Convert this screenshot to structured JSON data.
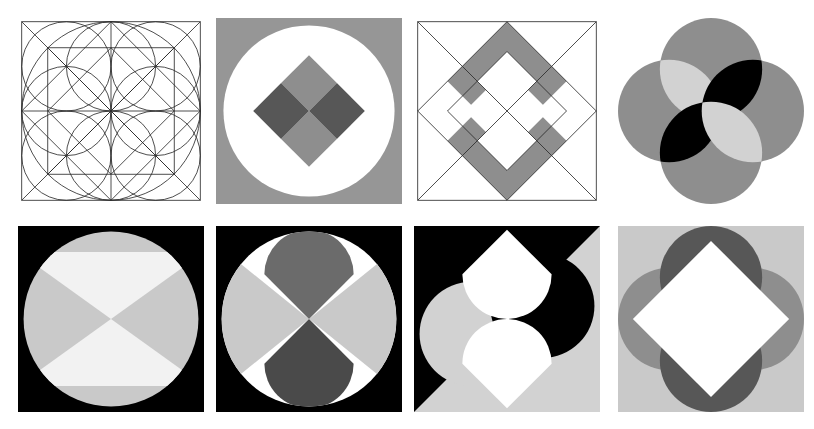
{
  "sheet": {
    "title": "Geometric composition plate",
    "width": 814,
    "height": 429,
    "background": "#ffffff",
    "rows": 2,
    "columns": 4,
    "panel_count": 8
  },
  "palette": {
    "white": "#ffffff",
    "near_white": "#f2f2f2",
    "light_gray": "#d2d2d2",
    "pale_gray": "#c9c9c9",
    "mid_gray": "#969696",
    "gray": "#8e8e8e",
    "dark_gray": "#6b6b6b",
    "darker_gray": "#575757",
    "charcoal": "#4a4a4a",
    "black": "#000000",
    "stroke": "#2b2b2b"
  },
  "panels": [
    {
      "index": 1,
      "name": "construction-grid",
      "row": 1,
      "column": 1,
      "x": 18,
      "y": 18,
      "width": 186,
      "height": 186,
      "background": "#ffffff",
      "style": "line-drawing",
      "description": "Square with inscribed circle, diagonals, midlines, rotated inner square and four tangent circles",
      "elements": [
        "outer-square",
        "inscribed-circle",
        "diagonals",
        "midlines",
        "inner-diamond",
        "inner-square",
        "four-quadrant-circles"
      ],
      "stroke_color": "#2b2b2b",
      "fill_color": "none"
    },
    {
      "index": 2,
      "name": "circle-quartered-diamond",
      "row": 1,
      "column": 2,
      "x": 216,
      "y": 18,
      "width": 186,
      "height": 186,
      "background": "#969696",
      "style": "solid-fill",
      "description": "Gray square, white inscribed circle, diamond split in four quadrants",
      "elements": [
        "gray-square",
        "white-circle",
        "diamond-top-quadrant",
        "diamond-bottom-quadrant",
        "diamond-left-quadrant",
        "diamond-right-quadrant"
      ],
      "fills": {
        "square": "#969696",
        "circle": "#ffffff",
        "diamond_vertical": "#8e8e8e",
        "diamond_horizontal": "#575757"
      }
    },
    {
      "index": 3,
      "name": "nested-diamond-band",
      "row": 1,
      "column": 3,
      "x": 414,
      "y": 18,
      "width": 186,
      "height": 186,
      "background": "#ffffff",
      "style": "line-drawing",
      "description": "Square with diagonals, large diamond and smaller inner diamond; band shaded gray at top and bottom chevrons",
      "elements": [
        "outer-square",
        "diagonals",
        "outer-diamond",
        "inner-diamond",
        "top-chevron-band",
        "bottom-chevron-band"
      ],
      "stroke_color": "#2b2b2b",
      "band_fill": "#8e8e8e"
    },
    {
      "index": 4,
      "name": "four-circle-rosette",
      "row": 1,
      "column": 4,
      "x": 618,
      "y": 18,
      "width": 186,
      "height": 186,
      "background": "#ffffff",
      "style": "solid-fill",
      "description": "Four overlapping gray circles in a cross; lens intersections alternate light and black",
      "elements": [
        "circle-top",
        "circle-right",
        "circle-bottom",
        "circle-left",
        "lens-top-left-light",
        "lens-top-right-black",
        "lens-bottom-left-black",
        "lens-bottom-right-light"
      ],
      "fills": {
        "circles": "#8e8e8e",
        "lens_light": "#d2d2d2",
        "lens_dark": "#000000"
      }
    },
    {
      "index": 5,
      "name": "hourglass-in-circle",
      "row": 2,
      "column": 1,
      "x": 18,
      "y": 226,
      "width": 186,
      "height": 186,
      "background": "#000000",
      "style": "solid-fill",
      "description": "Black square, light gray circle, white hourglass of two triangles meeting at centre",
      "elements": [
        "black-square",
        "gray-circle",
        "triangle-top",
        "triangle-bottom"
      ],
      "fills": {
        "square": "#000000",
        "circle": "#c9c9c9",
        "triangles": "#f2f2f2"
      }
    },
    {
      "index": 6,
      "name": "four-lobe-circle",
      "row": 2,
      "column": 2,
      "x": 216,
      "y": 226,
      "width": 186,
      "height": 186,
      "background": "#000000",
      "style": "solid-fill",
      "description": "Black square, white circle, light gray side wedges, mid gray top lobe and dark gray bottom lobe",
      "elements": [
        "black-square",
        "white-circle",
        "wedge-left",
        "wedge-right",
        "lobe-top",
        "lobe-bottom"
      ],
      "fills": {
        "square": "#000000",
        "circle": "#ffffff",
        "wedges": "#c9c9c9",
        "lobe_top": "#6b6b6b",
        "lobe_bottom": "#4a4a4a"
      }
    },
    {
      "index": 7,
      "name": "diagonal-split-teardrops",
      "row": 2,
      "column": 3,
      "x": 414,
      "y": 226,
      "width": 186,
      "height": 186,
      "background": "#000000",
      "style": "solid-fill",
      "description": "Square split diagonally black and light gray, with two white teardrop shapes and two tinted circles",
      "elements": [
        "black-half",
        "gray-half",
        "circle-upper-left-gray",
        "circle-lower-right-black",
        "teardrop-upper",
        "teardrop-lower"
      ],
      "fills": {
        "dark_half": "#000000",
        "light_half": "#d2d2d2",
        "teardrops": "#ffffff"
      }
    },
    {
      "index": 8,
      "name": "rosette-with-white-diamond",
      "row": 2,
      "column": 4,
      "x": 618,
      "y": 226,
      "width": 186,
      "height": 186,
      "background": "#c9c9c9",
      "style": "solid-fill",
      "description": "Light gray square, four circles (dark gray vertical pair, mid gray horizontal pair), white diamond on top",
      "elements": [
        "light-square",
        "circle-top",
        "circle-bottom",
        "circle-left",
        "circle-right",
        "white-diamond"
      ],
      "fills": {
        "square": "#c9c9c9",
        "circle_vertical": "#575757",
        "circle_horizontal": "#8e8e8e",
        "diamond": "#ffffff"
      }
    }
  ]
}
